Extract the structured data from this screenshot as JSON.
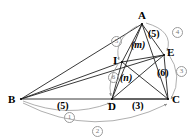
{
  "figure": {
    "background_color": "#ffffff",
    "line_color": "#222222",
    "arc_color": "#8d8d8d",
    "circle_number_color": "#777777"
  },
  "vertices": [
    {
      "name": "A",
      "label": "A",
      "x": 142,
      "y": 24
    },
    {
      "name": "B",
      "label": "B",
      "x": 21,
      "y": 99
    },
    {
      "name": "C",
      "label": "C",
      "x": 168,
      "y": 99
    },
    {
      "name": "D",
      "label": "D",
      "x": 112,
      "y": 99
    },
    {
      "name": "E",
      "label": "E",
      "x": 164,
      "y": 55
    },
    {
      "name": "I",
      "label": "I",
      "x": 122,
      "y": 62
    }
  ],
  "vertex_labels": [
    {
      "key": "A",
      "text": "A",
      "left": 138,
      "top": 10
    },
    {
      "key": "B",
      "text": "B",
      "left": 8,
      "top": 94
    },
    {
      "key": "C",
      "text": "C",
      "left": 172,
      "top": 94
    },
    {
      "key": "D",
      "text": "D",
      "left": 108,
      "top": 101
    },
    {
      "key": "E",
      "text": "E",
      "left": 167,
      "top": 47
    },
    {
      "key": "I",
      "text": "I",
      "left": 113,
      "top": 55
    }
  ],
  "segment_labels": [
    {
      "key": "AE",
      "text": "(5)",
      "left": 148,
      "top": 29,
      "style": "seglen"
    },
    {
      "key": "AI",
      "text": "(m)",
      "left": 131,
      "top": 40,
      "style": "varlen"
    },
    {
      "key": "ID",
      "text": "(n)",
      "left": 120,
      "top": 73,
      "style": "varlen"
    },
    {
      "key": "EC",
      "text": "(6)",
      "left": 157,
      "top": 68,
      "style": "seglen"
    },
    {
      "key": "BD",
      "text": "(5)",
      "left": 57,
      "top": 101,
      "style": "seglen"
    },
    {
      "key": "DC",
      "text": "(3)",
      "left": 132,
      "top": 101,
      "style": "seglen"
    }
  ],
  "circled_numbers": [
    {
      "key": "step-1",
      "text": "1",
      "left": 64,
      "top": 112
    },
    {
      "key": "step-2",
      "text": "2",
      "left": 92,
      "top": 126
    },
    {
      "key": "step-3",
      "text": "3",
      "left": 176,
      "top": 66
    },
    {
      "key": "step-4",
      "text": "4",
      "left": 172,
      "top": 27
    },
    {
      "key": "step-5",
      "text": "5",
      "left": 111,
      "top": 36
    },
    {
      "key": "step-6",
      "text": "6",
      "left": 108,
      "top": 72
    }
  ],
  "edges": [
    {
      "key": "A-B",
      "from": "A",
      "to": "B"
    },
    {
      "key": "A-C",
      "from": "A",
      "to": "C"
    },
    {
      "key": "A-D",
      "from": "A",
      "to": "D"
    },
    {
      "key": "A-I",
      "from": "A",
      "to": "I"
    },
    {
      "key": "A-E",
      "from": "A",
      "to": "E"
    },
    {
      "key": "B-C",
      "from": "B",
      "to": "C"
    },
    {
      "key": "B-D",
      "from": "B",
      "to": "D"
    },
    {
      "key": "B-I",
      "from": "B",
      "to": "I"
    },
    {
      "key": "B-E",
      "from": "B",
      "to": "E"
    },
    {
      "key": "I-D",
      "from": "I",
      "to": "D"
    },
    {
      "key": "I-E",
      "from": "I",
      "to": "E"
    },
    {
      "key": "I-C",
      "from": "I",
      "to": "C"
    },
    {
      "key": "E-C",
      "from": "E",
      "to": "C"
    },
    {
      "key": "E-D",
      "from": "E",
      "to": "D"
    },
    {
      "key": "D-C",
      "from": "D",
      "to": "C"
    }
  ],
  "construction_arcs": [
    {
      "key": "arc-1",
      "label": "1",
      "note": "arc from B to D below base"
    },
    {
      "key": "arc-2",
      "label": "2",
      "note": "arc from B to C, outermost below base"
    },
    {
      "key": "arc-3",
      "label": "3",
      "note": "arc from E to C on right side"
    },
    {
      "key": "arc-4",
      "label": "4",
      "note": "arc from A to E on upper right"
    },
    {
      "key": "arc-5",
      "label": "5",
      "note": "arc from A down to I on left of AI"
    },
    {
      "key": "arc-6",
      "label": "6",
      "note": "arc from I down to D"
    }
  ]
}
